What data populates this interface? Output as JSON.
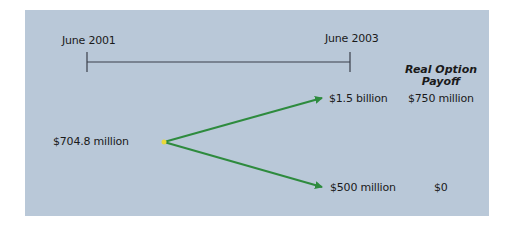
{
  "timeline": {
    "start_label": "June 2001",
    "end_label": "June 2003"
  },
  "column_header": {
    "line1": "Real Option",
    "line2": "Payoff"
  },
  "start_value": "$704.8 million",
  "outcomes": [
    {
      "value": "$1.5 billion",
      "payoff": "$750 million"
    },
    {
      "value": "$500 million",
      "payoff": "$0"
    }
  ],
  "colors": {
    "panel_bg": "#b9c8d8",
    "arrow": "#2e8b3e",
    "start_dot": "#e8d83a",
    "timeline": "#3a3f4a"
  }
}
